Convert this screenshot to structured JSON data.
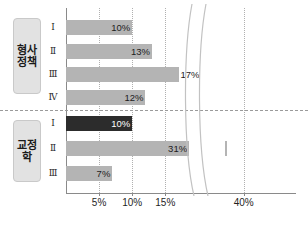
{
  "chart_data": {
    "type": "bar",
    "orientation": "horizontal",
    "title": "",
    "xlabel": "",
    "ylabel": "",
    "xlim": [
      0,
      45
    ],
    "xticks": [
      5,
      10,
      15,
      40
    ],
    "xticklabels": [
      "5%",
      "10%",
      "15%",
      "40%"
    ],
    "grid": "vertical-dotted",
    "legend": "none",
    "axis_break": {
      "present": true,
      "between": [
        17,
        38
      ],
      "style": "double-curve"
    },
    "groups": [
      {
        "label": "형사정책",
        "categories": [
          "Ⅰ",
          "Ⅱ",
          "Ⅲ",
          "Ⅳ"
        ],
        "values": [
          10,
          13,
          17,
          12
        ],
        "value_labels": [
          "10%",
          "13%",
          "17%",
          "12%"
        ],
        "colors": [
          "#b4b4b4",
          "#b4b4b4",
          "#b4b4b4",
          "#b4b4b4"
        ]
      },
      {
        "label": "교정학",
        "categories": [
          "Ⅰ",
          "Ⅱ",
          "Ⅲ"
        ],
        "values": [
          10,
          31,
          7
        ],
        "value_labels": [
          "10%",
          "31%",
          "7%"
        ],
        "colors": [
          "#2c2c2c",
          "#b4b4b4",
          "#b4b4b4"
        ]
      }
    ]
  },
  "colors": {
    "bar_light": "#b4b4b4",
    "bar_dark": "#2c2c2c",
    "axis": "#8a8a8a",
    "grid": "#b0b0b0",
    "label_box": "#e2e2e2",
    "text": "#1c1c1c"
  }
}
